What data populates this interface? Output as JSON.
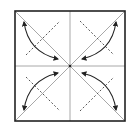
{
  "diagram": {
    "type": "origami-fold-diagram",
    "square": {
      "x": 15,
      "y": 11,
      "size": 110,
      "border_color": "#222222"
    },
    "center": {
      "x": 70,
      "y": 66
    },
    "fold_line_color": "#a8a8a8",
    "dash_line_color": "#555555",
    "arrow_color": "#222222",
    "folds": [
      {
        "name": "top-left",
        "direction": "corner-to-center"
      },
      {
        "name": "top-right",
        "direction": "corner-to-center"
      },
      {
        "name": "bottom-left",
        "direction": "corner-to-center"
      },
      {
        "name": "bottom-right",
        "direction": "corner-to-center"
      }
    ]
  }
}
